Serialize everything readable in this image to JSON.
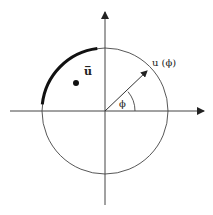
{
  "diagram": {
    "labels": {
      "u_bar": "u̅",
      "u_phi": "u (ϕ)",
      "phi": "ϕ"
    },
    "colors": {
      "stroke": "#333333",
      "arc": "#111111",
      "background": "#ffffff"
    },
    "geometry": {
      "center": [
        105,
        111
      ],
      "radius": 63,
      "bold_arc_degrees": [
        97,
        174
      ],
      "vector_angle_degrees": 40,
      "point": [
        77,
        82
      ]
    }
  }
}
